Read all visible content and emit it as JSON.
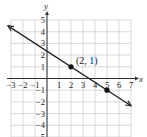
{
  "chart_data": {
    "type": "line",
    "title": "",
    "xlabel": "x",
    "ylabel": "y",
    "xlim": [
      -3,
      7
    ],
    "ylim": [
      -5,
      5
    ],
    "grid": true,
    "x_ticks": [
      -3,
      -2,
      -1,
      1,
      2,
      3,
      4,
      5,
      6,
      7
    ],
    "y_ticks": [
      -5,
      -4,
      -3,
      -2,
      -1,
      1,
      2,
      3,
      4,
      5
    ],
    "x_tick_labels": [
      "−3",
      "−2",
      "−1",
      "1",
      "2",
      "3",
      "4",
      "5",
      "6",
      "7"
    ],
    "y_tick_labels": [
      "−5",
      "−4",
      "−3",
      "−2",
      "−1",
      "1",
      "2",
      "3",
      "4",
      "5"
    ],
    "series": [
      {
        "name": "line",
        "slope": -0.6667,
        "intercept": 2.3333,
        "x": [
          -3,
          7
        ],
        "y": [
          4.33,
          -2.33
        ],
        "arrows": "both"
      }
    ],
    "points": [
      {
        "x": 2,
        "y": 1,
        "label": "(2, 1)"
      },
      {
        "x": 5,
        "y": -1,
        "label": ""
      }
    ],
    "annotations": [
      {
        "text": "(2, 1)",
        "x": 2,
        "y": 1
      }
    ]
  },
  "labels": {
    "x_axis": "x",
    "y_axis": "y",
    "point_label": "(2, 1)"
  },
  "colors": {
    "grid": "#c8c8c8",
    "axis": "#333333",
    "line": "#222222",
    "point": "#111111"
  }
}
